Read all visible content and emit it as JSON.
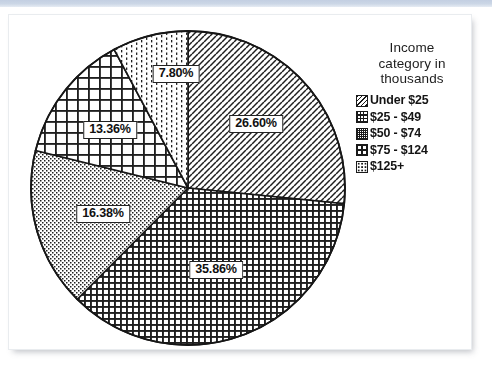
{
  "document": {
    "background_color": "#ffffff",
    "banner_color": "#c6d2e4",
    "card_border_color": "#e9ecef"
  },
  "legend": {
    "title_line_1": "Income",
    "title_line_2": "category in",
    "title_line_3": "thousands",
    "title_full": "Income category in thousands",
    "items": [
      {
        "label": "Under $25",
        "swatch": "diagonal-hatch-icon",
        "swatch_class": "sw-diag"
      },
      {
        "label": "$25 - $49",
        "swatch": "dense-grid-icon",
        "swatch_class": "sw-grid-dense"
      },
      {
        "label": "$50 - $74",
        "swatch": "stipple-icon",
        "swatch_class": "sw-stipple"
      },
      {
        "label": "$75 - $124",
        "swatch": "coarse-grid-icon",
        "swatch_class": "sw-grid-coarse"
      },
      {
        "label": "$125+",
        "swatch": "sparse-dots-icon",
        "swatch_class": "sw-dots"
      }
    ]
  },
  "chart_data": {
    "type": "pie",
    "title": "Income category in thousands",
    "xlabel": "",
    "ylabel": "",
    "units": "percent",
    "start_angle_deg": 0,
    "direction": "clockwise",
    "categories": [
      "Under $25",
      "$25 - $49",
      "$50 - $74",
      "$75 - $124",
      "$125+"
    ],
    "values": [
      26.6,
      35.86,
      16.38,
      13.36,
      7.8
    ],
    "data_labels": [
      "26.60%",
      "35.86%",
      "16.38%",
      "13.36%",
      "7.80%"
    ],
    "patterns": [
      "diagonal-hatch",
      "dense-grid",
      "stipple",
      "coarse-grid",
      "sparse-vertical-dots"
    ],
    "legend_position": "right",
    "grid": false,
    "geometry": {
      "center_x": 188,
      "center_y": 188,
      "radius": 157
    },
    "label_positions": [
      {
        "label": "26.60%",
        "x": 256,
        "y": 124
      },
      {
        "label": "35.86%",
        "x": 216,
        "y": 270
      },
      {
        "label": "16.38%",
        "x": 103,
        "y": 214
      },
      {
        "label": "13.36%",
        "x": 110,
        "y": 130
      },
      {
        "label": "7.80%",
        "x": 176,
        "y": 74
      }
    ]
  }
}
